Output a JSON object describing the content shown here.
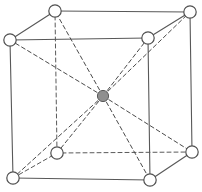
{
  "figure": {
    "name": "body-centered-cubic-unit-cell",
    "kind": "crystal-lattice-diagram",
    "title": "",
    "caption": "",
    "background_color": "#ffffff",
    "width": 202,
    "height": 192
  },
  "style": {
    "edge_color": "#585858",
    "edge_width": 1.1,
    "hidden_edge_color": "#5a5a5a",
    "hidden_edge_width": 1.0,
    "hidden_edge_dash": "4,3",
    "diagonal_color": "#4a4a4a",
    "diagonal_width": 1.0,
    "diagonal_dash": "4,3",
    "corner_atom_fill": "#ffffff",
    "corner_atom_stroke": "#4f4f4f",
    "corner_atom_stroke_width": 1.2,
    "corner_atom_radius": 6.2,
    "center_atom_fill": "#8f8f8f",
    "center_atom_stroke": "#5a5a5a",
    "center_atom_stroke_width": 1.0,
    "center_atom_radius": 5.6
  },
  "atoms": [
    {
      "id": "back-top-left",
      "label": "",
      "x": 55,
      "y": 11,
      "type": "corner",
      "hidden": false
    },
    {
      "id": "back-top-right",
      "label": "",
      "x": 190,
      "y": 12,
      "type": "corner",
      "hidden": false
    },
    {
      "id": "front-top-left",
      "label": "",
      "x": 10,
      "y": 40,
      "type": "corner",
      "hidden": false
    },
    {
      "id": "front-top-right",
      "label": "",
      "x": 148,
      "y": 38,
      "type": "corner",
      "hidden": false
    },
    {
      "id": "back-bottom-left",
      "label": "",
      "x": 57,
      "y": 153,
      "type": "corner",
      "hidden": true
    },
    {
      "id": "back-bottom-right",
      "label": "",
      "x": 192,
      "y": 152,
      "type": "corner",
      "hidden": false
    },
    {
      "id": "front-bottom-left",
      "label": "",
      "x": 13,
      "y": 178,
      "type": "corner",
      "hidden": false
    },
    {
      "id": "front-bottom-right",
      "label": "",
      "x": 150,
      "y": 180,
      "type": "corner",
      "hidden": false
    },
    {
      "id": "body-center",
      "label": "",
      "x": 103,
      "y": 96,
      "type": "center",
      "hidden": false
    }
  ],
  "edges": [
    {
      "from": "front-top-left",
      "to": "front-top-right",
      "style": "solid"
    },
    {
      "from": "front-top-right",
      "to": "front-bottom-right",
      "style": "solid"
    },
    {
      "from": "front-bottom-right",
      "to": "front-bottom-left",
      "style": "solid"
    },
    {
      "from": "front-bottom-left",
      "to": "front-top-left",
      "style": "solid"
    },
    {
      "from": "back-top-left",
      "to": "back-top-right",
      "style": "solid"
    },
    {
      "from": "back-top-right",
      "to": "back-bottom-right",
      "style": "solid"
    },
    {
      "from": "back-bottom-right",
      "to": "back-bottom-left",
      "style": "dashed"
    },
    {
      "from": "back-bottom-left",
      "to": "back-top-left",
      "style": "dashed"
    },
    {
      "from": "front-top-left",
      "to": "back-top-left",
      "style": "solid"
    },
    {
      "from": "front-top-right",
      "to": "back-top-right",
      "style": "solid"
    },
    {
      "from": "front-bottom-right",
      "to": "back-bottom-right",
      "style": "solid"
    },
    {
      "from": "front-bottom-left",
      "to": "back-bottom-left",
      "style": "dashed"
    }
  ],
  "diagonals": [
    {
      "from": "body-center",
      "to": "back-top-left",
      "style": "dashed"
    },
    {
      "from": "body-center",
      "to": "back-top-right",
      "style": "dashed"
    },
    {
      "from": "body-center",
      "to": "front-top-left",
      "style": "dashed"
    },
    {
      "from": "body-center",
      "to": "front-top-right",
      "style": "dashed"
    },
    {
      "from": "body-center",
      "to": "back-bottom-left",
      "style": "dashed"
    },
    {
      "from": "body-center",
      "to": "back-bottom-right",
      "style": "dashed"
    },
    {
      "from": "body-center",
      "to": "front-bottom-left",
      "style": "dashed"
    },
    {
      "from": "body-center",
      "to": "front-bottom-right",
      "style": "dashed"
    }
  ],
  "chart_data": {
    "type": "diagram",
    "title": "",
    "xlabel": "",
    "ylabel": "",
    "structure": "body-centered cubic (BCC)",
    "corner_atom_count": 8,
    "center_atom_count": 1,
    "total_atoms_drawn": 9,
    "edge_count": 12,
    "body_diagonal_count": 8
  }
}
